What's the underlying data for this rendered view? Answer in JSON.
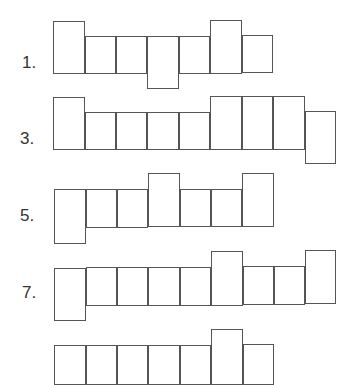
{
  "worksheet": {
    "line_color": "#555555",
    "figures": [
      {
        "label": "1.",
        "label_pos": [
          22,
          66
        ],
        "squares": [
          [
            53,
            21,
            32,
            53
          ],
          [
            85,
            36,
            31,
            38
          ],
          [
            116,
            36,
            31,
            38
          ],
          [
            147,
            36,
            32,
            53
          ],
          [
            179,
            36,
            31,
            38
          ],
          [
            210,
            20,
            32,
            54
          ],
          [
            242,
            35,
            31,
            38
          ]
        ]
      },
      {
        "label": "3.",
        "label_pos": [
          20,
          142
        ],
        "squares": [
          [
            53,
            97,
            32,
            53
          ],
          [
            85,
            112,
            31,
            38
          ],
          [
            116,
            112,
            31,
            38
          ],
          [
            147,
            112,
            32,
            38
          ],
          [
            179,
            112,
            31,
            38
          ],
          [
            210,
            96,
            32,
            54
          ],
          [
            242,
            96,
            31,
            54
          ],
          [
            273,
            96,
            32,
            54
          ],
          [
            305,
            111,
            31,
            53
          ]
        ]
      },
      {
        "label": "5.",
        "label_pos": [
          20,
          219
        ],
        "squares": [
          [
            54,
            189,
            32,
            55
          ],
          [
            86,
            189,
            31,
            39
          ],
          [
            117,
            189,
            31,
            39
          ],
          [
            148,
            173,
            32,
            54
          ],
          [
            180,
            189,
            31,
            38
          ],
          [
            211,
            189,
            31,
            38
          ],
          [
            242,
            173,
            32,
            54
          ]
        ]
      },
      {
        "label": "7.",
        "label_pos": [
          22,
          296
        ],
        "squares": [
          [
            54,
            268,
            32,
            53
          ],
          [
            86,
            267,
            31,
            39
          ],
          [
            117,
            267,
            31,
            39
          ],
          [
            148,
            267,
            32,
            39
          ],
          [
            180,
            267,
            31,
            39
          ],
          [
            211,
            251,
            32,
            55
          ],
          [
            243,
            266,
            31,
            39
          ],
          [
            274,
            266,
            31,
            39
          ],
          [
            305,
            250,
            31,
            54
          ]
        ]
      },
      {
        "label": "",
        "label_pos": [
          20,
          370
        ],
        "squares": [
          [
            54,
            345,
            32,
            40
          ],
          [
            86,
            345,
            31,
            40
          ],
          [
            117,
            345,
            31,
            40
          ],
          [
            148,
            345,
            32,
            40
          ],
          [
            180,
            345,
            31,
            40
          ],
          [
            211,
            329,
            32,
            56
          ],
          [
            243,
            344,
            31,
            41
          ]
        ]
      }
    ]
  }
}
